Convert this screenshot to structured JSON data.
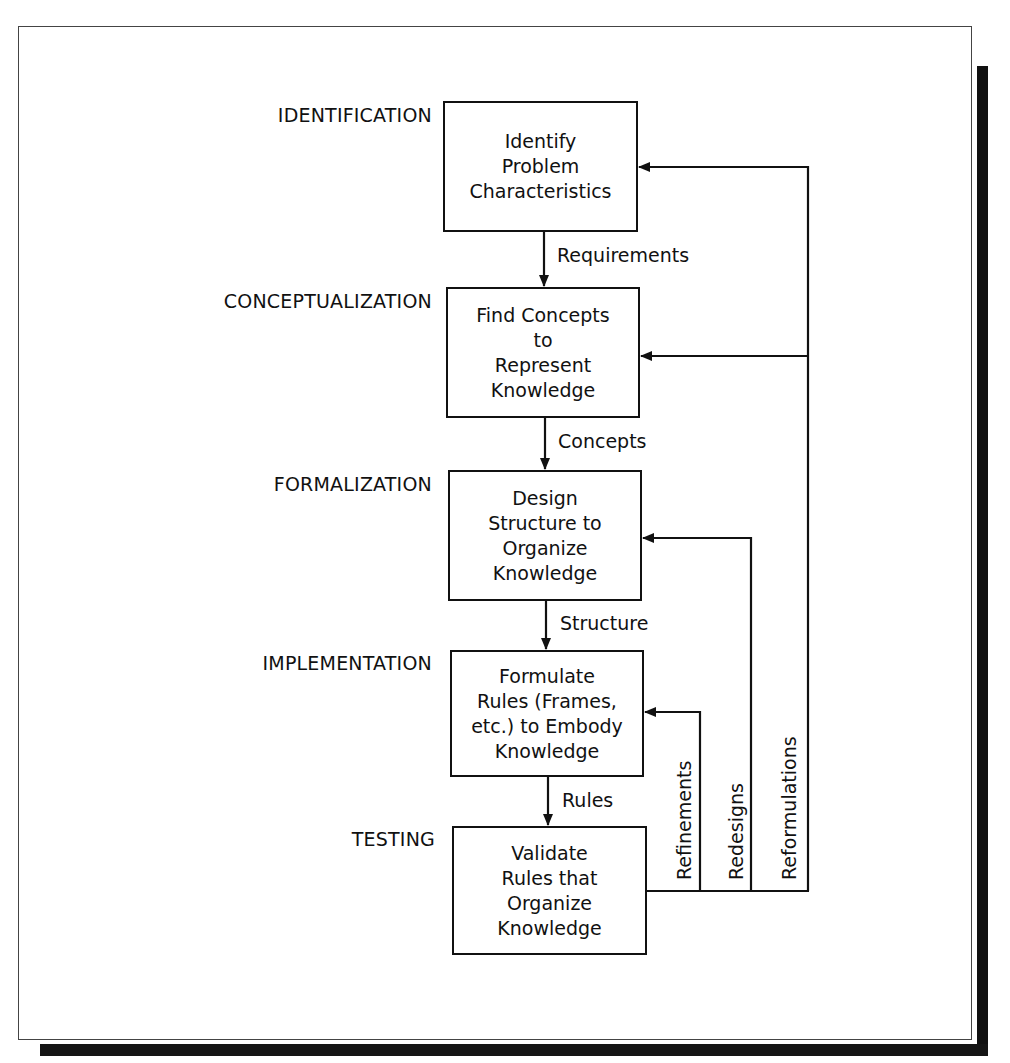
{
  "diagram": {
    "stages": [
      {
        "label": "IDENTIFICATION",
        "box_text": "Identify\nProblem\nCharacteristics",
        "output": "Requirements"
      },
      {
        "label": "CONCEPTUALIZATION",
        "box_text": "Find Concepts\nto\nRepresent\nKnowledge",
        "output": "Concepts"
      },
      {
        "label": "FORMALIZATION",
        "box_text": "Design\nStructure to\nOrganize\nKnowledge",
        "output": "Structure"
      },
      {
        "label": "IMPLEMENTATION",
        "box_text": "Formulate\nRules (Frames,\netc.) to Embody\nKnowledge",
        "output": "Rules"
      },
      {
        "label": "TESTING",
        "box_text": "Validate\nRules that\nOrganize\nKnowledge",
        "output": ""
      }
    ],
    "feedback_loops": [
      {
        "label": "Refinements",
        "from": "TESTING",
        "to": "IMPLEMENTATION"
      },
      {
        "label": "Redesigns",
        "from": "TESTING",
        "to": "FORMALIZATION"
      },
      {
        "label": "Reformulations",
        "from": "TESTING",
        "to": [
          "CONCEPTUALIZATION",
          "IDENTIFICATION"
        ]
      }
    ]
  },
  "colors": {
    "line": "#111111",
    "shadow": "#111111",
    "background": "#ffffff"
  }
}
